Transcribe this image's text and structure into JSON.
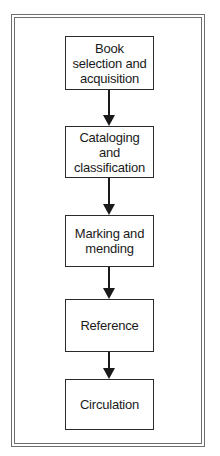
{
  "diagram": {
    "type": "flowchart",
    "direction": "top-to-bottom",
    "nodes": [
      {
        "id": "n1",
        "label": "Book\nselection and\nacquisition"
      },
      {
        "id": "n2",
        "label": "Cataloging\nand\nclassification"
      },
      {
        "id": "n3",
        "label": "Marking and\nmending"
      },
      {
        "id": "n4",
        "label": "Reference"
      },
      {
        "id": "n5",
        "label": "Circulation"
      }
    ],
    "edges": [
      {
        "from": "n1",
        "to": "n2"
      },
      {
        "from": "n2",
        "to": "n3"
      },
      {
        "from": "n3",
        "to": "n4"
      },
      {
        "from": "n4",
        "to": "n5"
      }
    ]
  },
  "colors": {
    "frame": "#6e6e6e",
    "box_border": "#2a2a2a",
    "arrow": "#1a1a1a",
    "background": "#ffffff"
  }
}
